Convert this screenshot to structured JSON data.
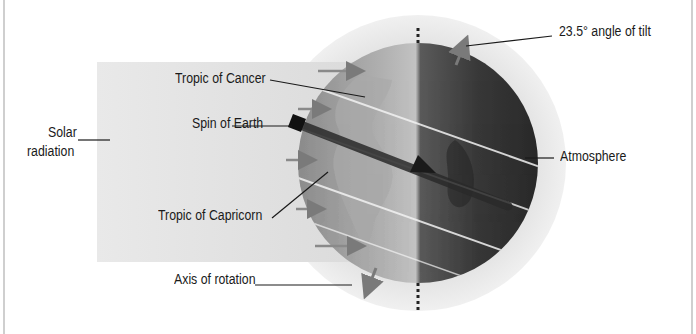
{
  "diagram": {
    "cut_off_heading": "",
    "labels": {
      "tropic_of_cancer": "Tropic of Cancer",
      "spin_of_earth": "Spin of Earth",
      "solar_radiation_line1": "Solar",
      "solar_radiation_line2": "radiation",
      "tropic_of_capricorn": "Tropic of Capricorn",
      "axis_of_rotation": "Axis of rotation",
      "angle_of_tilt": "23.5° angle of tilt",
      "atmosphere": "Atmosphere"
    },
    "colors": {
      "solar_band": "#e6e6e6",
      "atmosphere": "#ececec",
      "globe_lit": "#9a9a9a",
      "globe_dark": "#2e2e2e",
      "arrow": "#7a7a7a",
      "spin_arrow": "#222222",
      "leader_line": "#1a1a1a"
    }
  }
}
